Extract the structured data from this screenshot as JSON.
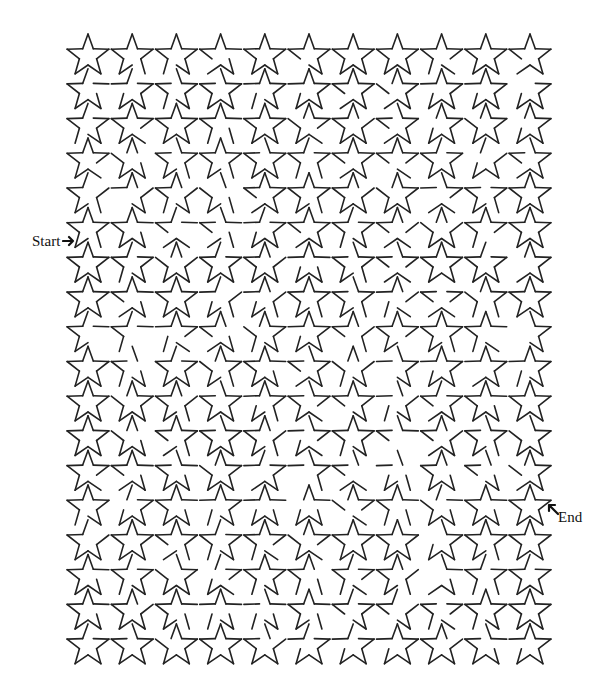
{
  "maze": {
    "shape": "star",
    "rows": 18,
    "cols": 11,
    "origin_x": 88,
    "origin_y": 56,
    "col_spacing": 44.2,
    "row_spacing": 34.7,
    "outer_radius": 22,
    "inner_radius": 9,
    "stroke_color": "#222222",
    "background": "#ffffff"
  },
  "labels": {
    "start": "Start",
    "end": "End"
  },
  "icons": {
    "start_arrow": "arrow-right-icon",
    "end_arrow": "arrow-up-left-icon"
  }
}
